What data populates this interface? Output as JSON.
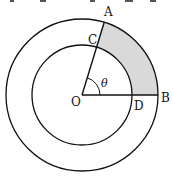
{
  "diagram": {
    "type": "concentric-circles-sector",
    "center": {
      "label": "O",
      "x": 82,
      "y": 95
    },
    "outer_radius": 76,
    "inner_radius": 50,
    "angle_deg": 73,
    "angle_label": "θ",
    "points": {
      "A": "A",
      "B": "B",
      "C": "C",
      "D": "D",
      "O": "O"
    },
    "shaded_region": "ACDB",
    "shade_color": "#d9d9d9",
    "stroke_color": "#111111"
  }
}
